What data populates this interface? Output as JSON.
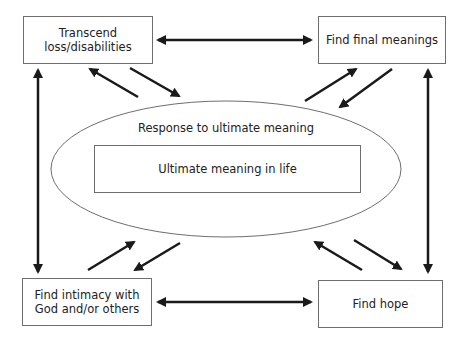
{
  "diagram": {
    "type": "concept-map",
    "center": {
      "outer_ellipse_label": "Response to ultimate meaning",
      "inner_box_label": "Ultimate meaning in life"
    },
    "nodes": [
      {
        "id": "transcend",
        "label_lines": [
          "Transcend",
          "loss/disabilities"
        ],
        "position": "top-left"
      },
      {
        "id": "final",
        "label_lines": [
          "Find final meanings"
        ],
        "position": "top-right"
      },
      {
        "id": "intimacy",
        "label_lines": [
          "Find intimacy with",
          "God and/or others"
        ],
        "position": "bottom-left"
      },
      {
        "id": "hope",
        "label_lines": [
          "Find hope"
        ],
        "position": "bottom-right"
      }
    ],
    "edges": [
      {
        "from": "transcend",
        "to": "final",
        "type": "bidirectional"
      },
      {
        "from": "intimacy",
        "to": "hope",
        "type": "bidirectional"
      },
      {
        "from": "transcend",
        "to": "intimacy",
        "type": "bidirectional"
      },
      {
        "from": "final",
        "to": "hope",
        "type": "bidirectional"
      },
      {
        "from": "transcend",
        "to": "center",
        "type": "two-way-pair"
      },
      {
        "from": "final",
        "to": "center",
        "type": "two-way-pair"
      },
      {
        "from": "intimacy",
        "to": "center",
        "type": "two-way-pair"
      },
      {
        "from": "hope",
        "to": "center",
        "type": "two-way-pair"
      }
    ],
    "colors": {
      "stroke": "#1a1a1a",
      "box_border": "#6e6e6e",
      "ellipse_stroke": "#6e6e6e",
      "background": "#ffffff"
    }
  }
}
